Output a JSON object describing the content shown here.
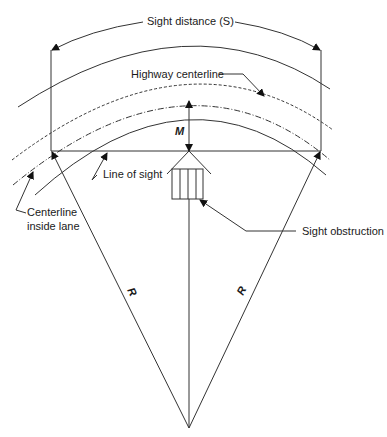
{
  "diagram": {
    "labels": {
      "sight_distance": "Sight distance (S)",
      "highway_centerline": "Highway centerline",
      "middle_ordinate": "M",
      "line_of_sight": "Line of sight",
      "centerline_inside_lane_1": "Centerline",
      "centerline_inside_lane_2": "inside lane",
      "sight_obstruction": "Sight obstruction",
      "radius_left": "R",
      "radius_right": "R"
    },
    "colors": {
      "line": "#333333",
      "text": "#1a1a1a",
      "background": "#ffffff"
    }
  }
}
